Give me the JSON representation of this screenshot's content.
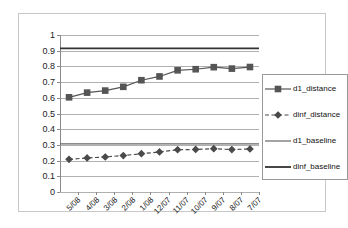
{
  "chart_data": {
    "type": "line",
    "title": "",
    "xlabel": "",
    "ylabel": "",
    "categories": [
      "5/08",
      "4/08",
      "3/08",
      "2/08",
      "1/08",
      "12/07",
      "11/07",
      "10/07",
      "9/07",
      "8/07",
      "7/07"
    ],
    "ylim": [
      0,
      1
    ],
    "ytick_labels": [
      "1",
      "0.9",
      "0.8",
      "0.7",
      "0.6",
      "0.5",
      "0.4",
      "0.3",
      "0.2",
      "0.1",
      "0"
    ],
    "ytick_values": [
      1,
      0.9,
      0.8,
      0.7,
      0.6,
      0.5,
      0.4,
      0.3,
      0.2,
      0.1,
      0
    ],
    "grid": true,
    "legend_position": "right",
    "series": [
      {
        "name": "d1_distance",
        "type": "line-marker",
        "marker": "square",
        "dash": "solid",
        "color": "#555555",
        "values": [
          0.603,
          0.633,
          0.646,
          0.67,
          0.712,
          0.736,
          0.775,
          0.782,
          0.795,
          0.786,
          0.796
        ]
      },
      {
        "name": "dinf_distance",
        "type": "line-marker",
        "marker": "diamond",
        "dash": "dashed",
        "color": "#4a4a4a",
        "values": [
          0.208,
          0.217,
          0.223,
          0.232,
          0.244,
          0.255,
          0.269,
          0.271,
          0.276,
          0.27,
          0.274
        ]
      },
      {
        "name": "d1_baseline",
        "type": "constant-line",
        "marker": "none",
        "dash": "solid",
        "color": "#666666",
        "value": 0.307
      },
      {
        "name": "dinf_baseline",
        "type": "constant-line",
        "marker": "none",
        "dash": "solid",
        "color": "#333333",
        "value": 0.915
      }
    ],
    "legend": [
      {
        "label": "d1_distance"
      },
      {
        "label": "dinf_distance"
      },
      {
        "label": "d1_baseline"
      },
      {
        "label": "dinf_baseline"
      }
    ]
  }
}
